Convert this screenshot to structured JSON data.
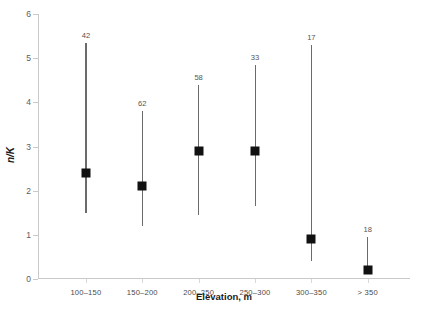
{
  "chart_data": {
    "type": "scatter",
    "title": "",
    "xlabel": "Elevation, m",
    "ylabel": "n/K",
    "categories": [
      "100–150",
      "150–200",
      "200–250",
      "250–300",
      "300–350",
      "> 350"
    ],
    "values": [
      2.5,
      2.2,
      3.0,
      3.0,
      1.0,
      0.3
    ],
    "error_low": [
      1.5,
      1.2,
      1.45,
      1.65,
      0.4,
      0.3
    ],
    "error_high": [
      5.35,
      3.8,
      4.4,
      4.85,
      5.3,
      0.95
    ],
    "point_labels": [
      "42",
      "62",
      "58",
      "33",
      "17",
      "18"
    ],
    "ylim": [
      0,
      6
    ],
    "yticks": [
      0,
      1,
      2,
      3,
      4,
      5,
      6
    ],
    "ytick_labels": [
      "0",
      "1",
      "2",
      "3",
      "4",
      "5",
      "6"
    ],
    "grid": false,
    "legend": "none",
    "marker": "filled-square",
    "marker_color": "#111111",
    "errorbar_color": "#6b6b6b",
    "axis_color": "#c9c9c9",
    "background_color": "#ffffff"
  }
}
